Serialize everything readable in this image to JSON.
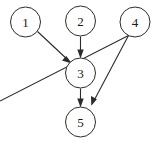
{
  "diagram": {
    "type": "directed-acyclic-graph",
    "title": "",
    "background_color": "#ffffff",
    "node_stroke_color": "#2b2b2b",
    "node_fill_color": "#ffffff",
    "edge_color": "#2b2b2b",
    "label_color": "#1a1a1a",
    "node_radius": 15,
    "nodes": [
      {
        "id": "1",
        "label": "1",
        "cx": 25.5,
        "cy": 22
      },
      {
        "id": "2",
        "label": "2",
        "cx": 80.5,
        "cy": 21
      },
      {
        "id": "4",
        "label": "4",
        "cx": 135,
        "cy": 22
      },
      {
        "id": "3",
        "label": "3",
        "cx": 80.5,
        "cy": 73
      },
      {
        "id": "5",
        "label": "5",
        "cx": 80.5,
        "cy": 122
      }
    ],
    "edges": [
      {
        "id": "edge-1-3",
        "from": "1",
        "to": "3",
        "x1": 37.5,
        "y1": 31.5,
        "x2": 70.5,
        "y2": 62.5
      },
      {
        "id": "edge-2-3",
        "from": "2",
        "to": "3",
        "x1": 80.5,
        "y1": 36.5,
        "x2": 80.5,
        "y2": 57.5
      },
      {
        "id": "edge-3-5",
        "from": "3",
        "to": "5",
        "x1": 80.5,
        "y1": 88.5,
        "x2": 80.5,
        "y2": 106.5
      },
      {
        "id": "edge-4-5",
        "from": "4",
        "to": "5",
        "x1": 128.5,
        "y1": 35.5,
        "x2": 91.5,
        "y2": 106.5
      }
    ]
  }
}
